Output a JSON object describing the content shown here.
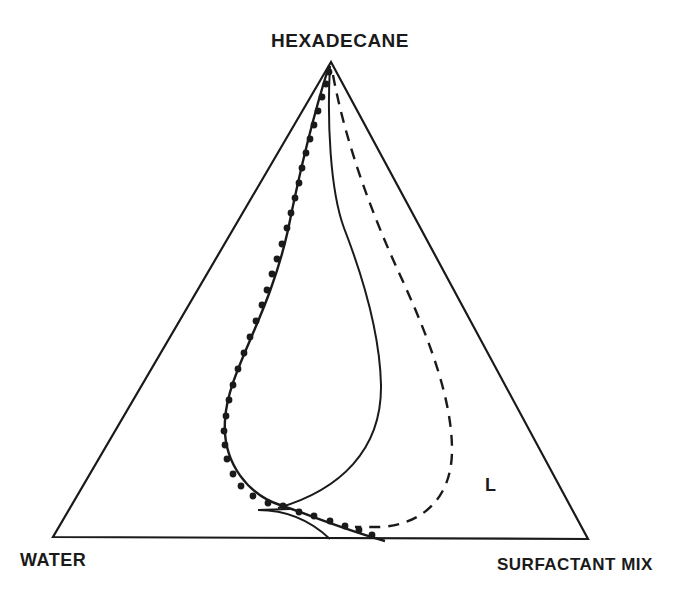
{
  "diagram": {
    "type": "ternary-phase-diagram",
    "vertices": {
      "top": "HEXADECANE",
      "bottom_left": "WATER",
      "bottom_right": "SURFACTANT MIX"
    },
    "region_label": "L",
    "colors": {
      "ink": "#1a1a1a",
      "background": "#ffffff"
    },
    "curves": [
      {
        "name": "dotted-boundary",
        "style": "solid line with filled circle markers"
      },
      {
        "name": "inner-solid-boundary",
        "style": "solid line"
      },
      {
        "name": "dashed-boundary",
        "style": "dashed line"
      },
      {
        "name": "lower-solid-arc",
        "style": "solid line"
      }
    ]
  }
}
